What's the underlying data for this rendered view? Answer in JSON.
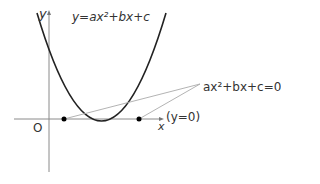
{
  "diagram": {
    "equation_label": "y=ax²+bx+c",
    "roots_label": "ax²+bx+c=0의 해",
    "x_axis_label": "x",
    "y_axis_label": "y",
    "origin_label": "O",
    "x_axis_equation": "(y=0)"
  },
  "colors": {
    "curve": "#222222",
    "axes": "#888888",
    "leader_lines": "#999999",
    "points": "#000000"
  }
}
